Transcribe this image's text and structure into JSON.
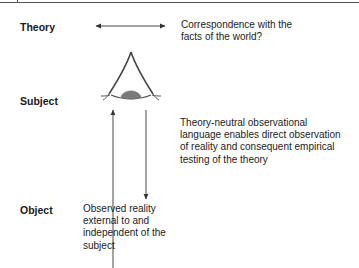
{
  "diagram": {
    "levels": {
      "theory": "Theory",
      "subject": "Subject",
      "object": "Object"
    },
    "annotations": {
      "correspondence": "Correspondence with the\nfacts of the world?",
      "observational_language": "Theory-neutral observational\nlanguage enables direct observation\nof reality and consequent empirical\ntesting of the theory",
      "observed_reality": "Observed reality\nexternal to and\nindependent of the\nsubject"
    },
    "icons": {
      "eye": "eye-icon",
      "theory_arrow": "double-headed-arrow-icon",
      "up_arrow": "up-arrow-icon",
      "down_arrow": "down-arrow-icon"
    },
    "colors": {
      "line": "#333333",
      "iris": "#7a7a7a",
      "text": "#1a1a1a"
    }
  }
}
